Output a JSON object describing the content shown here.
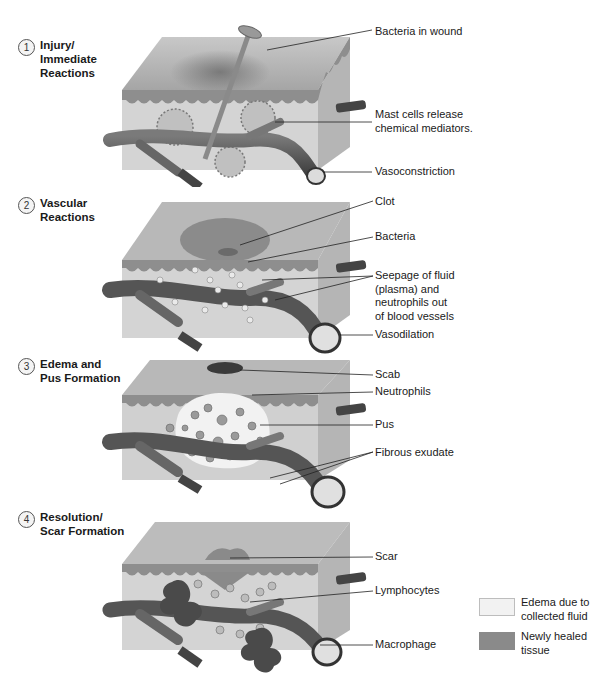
{
  "stages": [
    {
      "number": "1",
      "title": "Injury/\nImmediate\nReactions"
    },
    {
      "number": "2",
      "title": "Vascular\nReactions"
    },
    {
      "number": "3",
      "title": "Edema and\nPus Formation"
    },
    {
      "number": "4",
      "title": "Resolution/\nScar Formation"
    }
  ],
  "callouts": {
    "stage1": [
      "Bacteria in wound",
      "Mast cells release\nchemical mediators.",
      "Vasoconstriction"
    ],
    "stage2": [
      "Clot",
      "Bacteria",
      "Seepage of fluid\n(plasma) and\nneutrophils out\nof blood vessels",
      "Vasodilation"
    ],
    "stage3": [
      "Scab",
      "Neutrophils",
      "Pus",
      "Fibrous exudate"
    ],
    "stage4": [
      "Scar",
      "Lymphocytes",
      "Macrophage"
    ]
  },
  "legend": [
    {
      "label": "Edema due to\ncollected fluid",
      "color": "#f2f2f2"
    },
    {
      "label": "Newly healed\ntissue",
      "color": "#8a8a8a"
    }
  ],
  "colors": {
    "skin_top": "#b8b8b8",
    "epidermis": "#8e8e8e",
    "dermis": "#d2d2d2",
    "side": "#bdbdbd",
    "vessel": "#5a5a5a",
    "vessel_dark": "#333333"
  }
}
